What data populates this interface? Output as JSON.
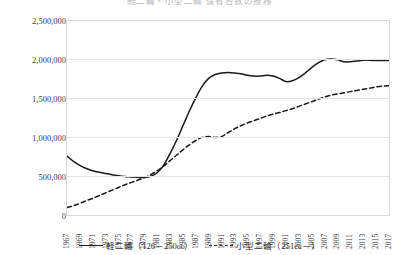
{
  "title": "軽二輪・小型二輪 保有台数の推移",
  "legend": {
    "series1_label": "軽二輪（126－250cc）",
    "series2_label": "小型二輪（251cc－）"
  },
  "chart_data": {
    "type": "line",
    "title": "軽二輪・小型二輪 保有台数の推移",
    "xlabel": "",
    "ylabel": "",
    "ylim": [
      0,
      2500000
    ],
    "ytick_labels": [
      "0",
      "500,000",
      "1,000,000",
      "1,500,000",
      "2,000,000",
      "2,500,000"
    ],
    "ytick_values": [
      0,
      500000,
      1000000,
      1500000,
      2000000,
      2500000
    ],
    "grid": true,
    "legend_position": "bottom-center",
    "x_tick_labels": [
      "1967",
      "1969",
      "1971",
      "1973",
      "1975",
      "1977",
      "1979",
      "1981",
      "1983",
      "1985",
      "1987",
      "1989",
      "1991",
      "1993",
      "1995",
      "1997",
      "1999",
      "2001",
      "2003",
      "2005",
      "2007",
      "2009",
      "2011",
      "2013",
      "2015",
      "2017"
    ],
    "x": [
      1967,
      1968,
      1969,
      1970,
      1971,
      1972,
      1973,
      1974,
      1975,
      1976,
      1977,
      1978,
      1979,
      1980,
      1981,
      1982,
      1983,
      1984,
      1985,
      1986,
      1987,
      1988,
      1989,
      1990,
      1991,
      1992,
      1993,
      1994,
      1995,
      1996,
      1997,
      1998,
      1999,
      2000,
      2001,
      2002,
      2003,
      2004,
      2005,
      2006,
      2007,
      2008,
      2009,
      2010,
      2011,
      2012,
      2013,
      2014,
      2015,
      2016,
      2017
    ],
    "series": [
      {
        "name": "軽二輪（126－250cc）",
        "style": "solid",
        "color": "#1a1a1a",
        "values": [
          760000,
          690000,
          640000,
          600000,
          570000,
          550000,
          535000,
          520000,
          505000,
          495000,
          490000,
          485000,
          485000,
          500000,
          545000,
          640000,
          790000,
          960000,
          1150000,
          1340000,
          1510000,
          1660000,
          1760000,
          1810000,
          1830000,
          1835000,
          1830000,
          1820000,
          1800000,
          1790000,
          1790000,
          1800000,
          1790000,
          1760000,
          1720000,
          1730000,
          1770000,
          1830000,
          1900000,
          1960000,
          2000000,
          2010000,
          2000000,
          1975000,
          1975000,
          1985000,
          1995000,
          1995000,
          1990000,
          1990000,
          1990000
        ]
      },
      {
        "name": "小型二輪（251cc－）",
        "style": "dashed",
        "color": "#1a1a1a",
        "values": [
          95000,
          120000,
          150000,
          185000,
          215000,
          250000,
          285000,
          320000,
          355000,
          390000,
          420000,
          450000,
          480000,
          520000,
          570000,
          630000,
          700000,
          770000,
          840000,
          905000,
          960000,
          1000000,
          1010000,
          1000000,
          1010000,
          1060000,
          1110000,
          1150000,
          1185000,
          1215000,
          1245000,
          1275000,
          1300000,
          1320000,
          1345000,
          1370000,
          1400000,
          1430000,
          1460000,
          1490000,
          1520000,
          1545000,
          1560000,
          1575000,
          1590000,
          1605000,
          1620000,
          1635000,
          1650000,
          1660000,
          1665000
        ]
      }
    ]
  }
}
